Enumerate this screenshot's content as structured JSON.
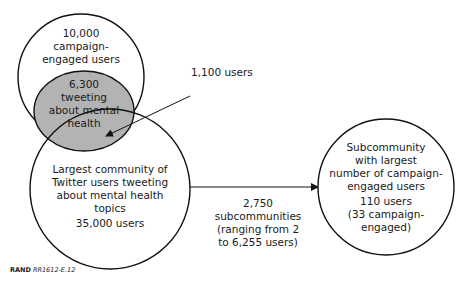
{
  "diagram": {
    "campaign_circle": {
      "count": "10,000",
      "label_lines": [
        "campaign-",
        "engaged users"
      ]
    },
    "mental_health_subset": {
      "count": "6,300",
      "label_lines": [
        "tweeting",
        "about mental",
        "health"
      ]
    },
    "overlap_annotation": "1,100 users",
    "largest_community": {
      "label_lines": [
        "Largest community of",
        "Twitter users tweeting",
        "about mental health",
        "topics"
      ],
      "count": "35,000 users"
    },
    "arrow_label_lines": [
      "2,750 subcommunities",
      "(ranging from 2",
      "to 6,255 users)"
    ],
    "subcommunity": {
      "label_lines": [
        "Subcommunity",
        "with largest",
        "number of campaign-",
        "engaged users"
      ],
      "count_lines": [
        "110 users",
        "(33 campaign-",
        "engaged)"
      ]
    },
    "colors": {
      "line": "#111111",
      "shaded": "#b3b3b3",
      "background": "#ffffff"
    }
  },
  "credit": {
    "org": "RAND",
    "id": "RR1612-E.12"
  }
}
